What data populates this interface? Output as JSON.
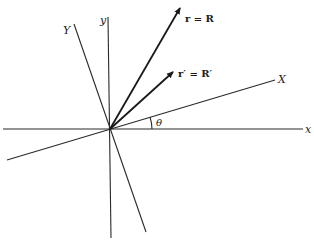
{
  "diagram": {
    "type": "rotated-coordinate-axes",
    "origin": {
      "x": 110,
      "y": 129
    },
    "axes": {
      "x": {
        "label": "x",
        "from": [
          3,
          129
        ],
        "to": [
          303,
          129
        ]
      },
      "y": {
        "label": "y",
        "from": [
          108,
          17
        ],
        "to": [
          111,
          238
        ]
      },
      "X": {
        "label": "X",
        "from": [
          7,
          160
        ],
        "to": [
          275,
          80
        ]
      },
      "Y": {
        "label": "Y",
        "from": [
          74,
          24
        ],
        "to": [
          146,
          232
        ]
      }
    },
    "vectors": [
      {
        "label": "r = R",
        "to": [
          181,
          6
        ]
      },
      {
        "label": "r′ = R′",
        "to": [
          174,
          71
        ]
      }
    ],
    "angle": {
      "label": "θ"
    }
  },
  "colors": {
    "line": "#2a2a2a",
    "background": "#ffffff"
  }
}
